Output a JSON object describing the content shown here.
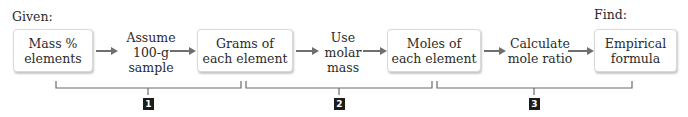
{
  "labels": {
    "given": "Given:",
    "find": "Find:"
  },
  "boxes": [
    {
      "line1": "Mass %",
      "line2": "elements"
    },
    {
      "line1": "Grams of",
      "line2": "each element"
    },
    {
      "line1": "Moles of",
      "line2": "each element"
    },
    {
      "line1": "Empirical",
      "line2": "formula"
    }
  ],
  "steps": [
    {
      "lines": [
        "Assume",
        "100-g",
        "sample"
      ]
    },
    {
      "lines": [
        "Use",
        "molar",
        "mass"
      ]
    },
    {
      "lines": [
        "Calculate",
        "mole ratio"
      ]
    }
  ],
  "badges": [
    "1",
    "2",
    "3"
  ],
  "colors": {
    "arrow": "#6f6f6f",
    "bracket": "#6a6a6a",
    "badge_bg": "#1c1c1c",
    "text": "#2b2b2b"
  }
}
